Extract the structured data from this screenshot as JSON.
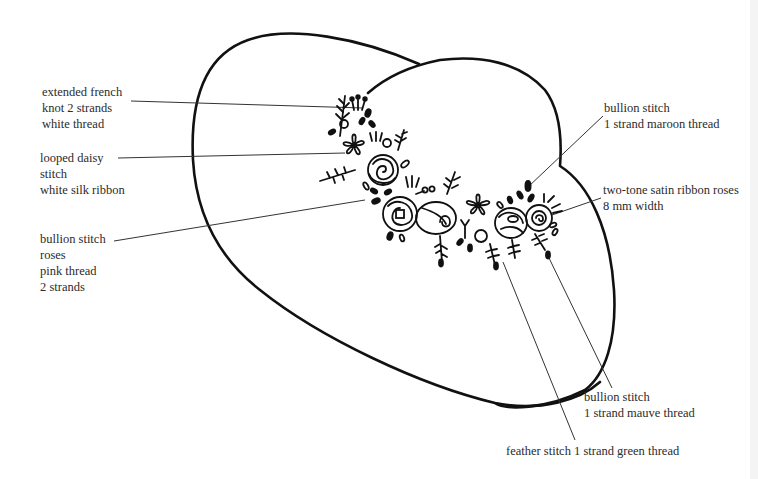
{
  "diagram": {
    "shapes": [
      "left-oval-outline",
      "right-oval-outline"
    ],
    "colors": {
      "ink": "#111111",
      "leader": "#333333",
      "text": "#2b2b2b",
      "background": "#ffffff"
    }
  },
  "labels": {
    "french_knot": {
      "lines": [
        "extended french",
        "knot 2 strands",
        "white thread"
      ]
    },
    "daisy": {
      "lines": [
        "looped daisy",
        "stitch",
        "white silk ribbon"
      ]
    },
    "bullion_roses": {
      "lines": [
        "bullion stitch",
        "roses",
        "pink thread",
        "2 strands"
      ]
    },
    "bullion_maroon": {
      "lines": [
        "bullion stitch",
        "1 strand maroon thread"
      ]
    },
    "satin_ribbon": {
      "lines": [
        "two-tone satin ribbon roses",
        "8 mm width"
      ]
    },
    "bullion_mauve": {
      "lines": [
        "bullion stitch",
        "1 strand mauve thread"
      ]
    },
    "feather": {
      "lines": [
        "feather stitch 1 strand green thread"
      ]
    }
  }
}
